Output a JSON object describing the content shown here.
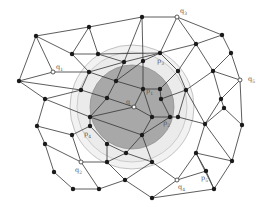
{
  "figure": {
    "type": "mesh-graph",
    "regions": {
      "outer_ring": {
        "cx": 132,
        "cy": 107,
        "r": 62,
        "color": "#f2f2f2",
        "stroke": "#aaaaaa"
      },
      "middle_ring": {
        "cx": 132,
        "cy": 107,
        "r": 55,
        "color": "#ebebeb",
        "stroke": "#bbbbbb"
      },
      "inner_disk": {
        "cx": 132,
        "cy": 107,
        "r": 42,
        "color": "#a8a8a8",
        "stroke": "#888888"
      }
    },
    "labels": {
      "q": "q",
      "q1": "q1",
      "q2": "q2",
      "q3": "q3",
      "q4": "q4",
      "q5": "q5",
      "p1": "p1",
      "p2": "p2",
      "p3": "p3",
      "p4": "p4",
      "p5": "p5"
    },
    "nodes": [
      {
        "id": "a1",
        "x": 36,
        "y": 36
      },
      {
        "id": "a2",
        "x": 89,
        "y": 27
      },
      {
        "id": "q3",
        "x": 177,
        "y": 17,
        "hollow": true
      },
      {
        "id": "a3",
        "x": 142,
        "y": 17
      },
      {
        "id": "a4",
        "x": 222,
        "y": 35
      },
      {
        "id": "a5",
        "x": 231,
        "y": 53
      },
      {
        "id": "q5",
        "x": 240,
        "y": 80,
        "hollow": true
      },
      {
        "id": "a6",
        "x": 72,
        "y": 54
      },
      {
        "id": "a7",
        "x": 98,
        "y": 54
      },
      {
        "id": "a8",
        "x": 196,
        "y": 44
      },
      {
        "id": "q1",
        "x": 53,
        "y": 72,
        "hollow": true
      },
      {
        "id": "a9",
        "x": 89,
        "y": 72
      },
      {
        "id": "a10",
        "x": 124,
        "y": 62
      },
      {
        "id": "p3",
        "x": 160,
        "y": 53
      },
      {
        "id": "a11",
        "x": 19,
        "y": 81
      },
      {
        "id": "a12",
        "x": 81,
        "y": 90
      },
      {
        "id": "a13",
        "x": 116,
        "y": 81
      },
      {
        "id": "a14",
        "x": 143,
        "y": 61
      },
      {
        "id": "a15",
        "x": 178,
        "y": 71
      },
      {
        "id": "a16",
        "x": 213,
        "y": 71
      },
      {
        "id": "a17",
        "x": 45,
        "y": 99
      },
      {
        "id": "a18",
        "x": 107,
        "y": 98
      },
      {
        "id": "p1",
        "x": 143,
        "y": 89
      },
      {
        "id": "a19",
        "x": 160,
        "y": 89
      },
      {
        "id": "a20",
        "x": 186,
        "y": 90
      },
      {
        "id": "a21",
        "x": 221,
        "y": 99
      },
      {
        "id": "a22",
        "x": 161,
        "y": 99
      },
      {
        "id": "q",
        "x": 134,
        "y": 107,
        "hollow": true
      },
      {
        "id": "a23",
        "x": 224,
        "y": 108
      },
      {
        "id": "a24",
        "x": 37,
        "y": 126
      },
      {
        "id": "a25",
        "x": 90,
        "y": 117
      },
      {
        "id": "p2",
        "x": 170,
        "y": 117
      },
      {
        "id": "a26",
        "x": 178,
        "y": 117
      },
      {
        "id": "a27",
        "x": 152,
        "y": 117
      },
      {
        "id": "a28",
        "x": 205,
        "y": 124
      },
      {
        "id": "a29",
        "x": 242,
        "y": 125
      },
      {
        "id": "p4",
        "x": 90,
        "y": 126
      },
      {
        "id": "a30",
        "x": 45,
        "y": 144
      },
      {
        "id": "a31",
        "x": 72,
        "y": 135
      },
      {
        "id": "a32",
        "x": 107,
        "y": 144
      },
      {
        "id": "a33",
        "x": 142,
        "y": 135
      },
      {
        "id": "a35",
        "x": 126,
        "y": 153
      },
      {
        "id": "a36",
        "x": 196,
        "y": 153
      },
      {
        "id": "a37",
        "x": 232,
        "y": 161
      },
      {
        "id": "q2",
        "x": 81,
        "y": 162,
        "hollow": true
      },
      {
        "id": "a38",
        "x": 54,
        "y": 172
      },
      {
        "id": "a39",
        "x": 107,
        "y": 162
      },
      {
        "id": "a40",
        "x": 152,
        "y": 162
      },
      {
        "id": "p5",
        "x": 206,
        "y": 171
      },
      {
        "id": "q4",
        "x": 177,
        "y": 180,
        "hollow": true
      },
      {
        "id": "a41",
        "x": 73,
        "y": 189
      },
      {
        "id": "a42",
        "x": 99,
        "y": 189
      },
      {
        "id": "a43",
        "x": 125,
        "y": 180
      },
      {
        "id": "a44",
        "x": 214,
        "y": 189
      },
      {
        "id": "a45",
        "x": 152,
        "y": 198
      }
    ],
    "edges": [
      [
        "a1",
        "a2"
      ],
      [
        "a2",
        "a3"
      ],
      [
        "a3",
        "q3"
      ],
      [
        "q3",
        "a4"
      ],
      [
        "a4",
        "a5"
      ],
      [
        "a5",
        "q5"
      ],
      [
        "a1",
        "q1"
      ],
      [
        "a1",
        "a6"
      ],
      [
        "a2",
        "a6"
      ],
      [
        "a2",
        "a7"
      ],
      [
        "a6",
        "a7"
      ],
      [
        "a6",
        "a9"
      ],
      [
        "a7",
        "a10"
      ],
      [
        "a10",
        "a3"
      ],
      [
        "a3",
        "a14"
      ],
      [
        "a14",
        "p3"
      ],
      [
        "q3",
        "p3"
      ],
      [
        "q3",
        "a8"
      ],
      [
        "a8",
        "a4"
      ],
      [
        "q1",
        "a11"
      ],
      [
        "q1",
        "a9"
      ],
      [
        "a11",
        "a1"
      ],
      [
        "a11",
        "a17"
      ],
      [
        "a11",
        "a12"
      ],
      [
        "a9",
        "a10"
      ],
      [
        "a9",
        "a12"
      ],
      [
        "a9",
        "a13"
      ],
      [
        "a10",
        "p3"
      ],
      [
        "a10",
        "a13"
      ],
      [
        "a7",
        "p3"
      ],
      [
        "p3",
        "a8"
      ],
      [
        "p3",
        "a15"
      ],
      [
        "a8",
        "a15"
      ],
      [
        "a8",
        "a16"
      ],
      [
        "a5",
        "a16"
      ],
      [
        "a16",
        "q5"
      ],
      [
        "a13",
        "a14"
      ],
      [
        "a14",
        "p1"
      ],
      [
        "a13",
        "p1"
      ],
      [
        "a13",
        "a18"
      ],
      [
        "a12",
        "a18"
      ],
      [
        "a12",
        "a17"
      ],
      [
        "a15",
        "a19"
      ],
      [
        "a15",
        "a20"
      ],
      [
        "a16",
        "a20"
      ],
      [
        "a16",
        "a21"
      ],
      [
        "q5",
        "a21"
      ],
      [
        "q5",
        "a29"
      ],
      [
        "p1",
        "a19"
      ],
      [
        "p1",
        "q"
      ],
      [
        "p1",
        "a27"
      ],
      [
        "a19",
        "a22"
      ],
      [
        "a22",
        "a20"
      ],
      [
        "a18",
        "q"
      ],
      [
        "a18",
        "a25"
      ],
      [
        "a17",
        "a25"
      ],
      [
        "a17",
        "a24"
      ],
      [
        "q",
        "a27"
      ],
      [
        "q",
        "a25"
      ],
      [
        "a20",
        "a26"
      ],
      [
        "a26",
        "p2"
      ],
      [
        "a22",
        "p2"
      ],
      [
        "a27",
        "p2"
      ],
      [
        "a21",
        "a23"
      ],
      [
        "a23",
        "a28"
      ],
      [
        "a23",
        "a29"
      ],
      [
        "a20",
        "a28"
      ],
      [
        "a26",
        "a28"
      ],
      [
        "a21",
        "a28"
      ],
      [
        "a25",
        "p4"
      ],
      [
        "a25",
        "a33"
      ],
      [
        "a24",
        "a30"
      ],
      [
        "a24",
        "a31"
      ],
      [
        "a31",
        "p4"
      ],
      [
        "a27",
        "a33"
      ],
      [
        "p2",
        "a33"
      ],
      [
        "a33",
        "a35"
      ],
      [
        "a32",
        "a35"
      ],
      [
        "p4",
        "a32"
      ],
      [
        "a28",
        "a36"
      ],
      [
        "a29",
        "a37"
      ],
      [
        "a36",
        "a37"
      ],
      [
        "a28",
        "a37"
      ],
      [
        "a30",
        "a38"
      ],
      [
        "a30",
        "q2"
      ],
      [
        "a31",
        "q2"
      ],
      [
        "q2",
        "a39"
      ],
      [
        "a32",
        "a39"
      ],
      [
        "a39",
        "a35"
      ],
      [
        "a35",
        "a40"
      ],
      [
        "a40",
        "q4"
      ],
      [
        "a33",
        "a40"
      ],
      [
        "a36",
        "p5"
      ],
      [
        "q4",
        "p5"
      ],
      [
        "p5",
        "a44"
      ],
      [
        "a37",
        "a44"
      ],
      [
        "a38",
        "a41"
      ],
      [
        "a41",
        "a42"
      ],
      [
        "a42",
        "q2"
      ],
      [
        "a42",
        "a43"
      ],
      [
        "a43",
        "a39"
      ],
      [
        "a43",
        "a40"
      ],
      [
        "a43",
        "a45"
      ],
      [
        "q4",
        "a45"
      ],
      [
        "a45",
        "a44"
      ],
      [
        "a44",
        "a36"
      ],
      [
        "q4",
        "a36"
      ]
    ],
    "label_positions": {
      "q": {
        "x": 126,
        "y": 104
      },
      "q1": {
        "x": 56,
        "y": 69
      },
      "q2": {
        "x": 75,
        "y": 172
      },
      "q3": {
        "x": 180,
        "y": 13
      },
      "q4": {
        "x": 178,
        "y": 189
      },
      "q5": {
        "x": 248,
        "y": 81
      },
      "p1": {
        "x": 146,
        "y": 93
      },
      "p2": {
        "x": 163,
        "y": 125
      },
      "p3": {
        "x": 157,
        "y": 63
      },
      "p4": {
        "x": 84,
        "y": 136
      },
      "p5": {
        "x": 201,
        "y": 180
      }
    }
  }
}
